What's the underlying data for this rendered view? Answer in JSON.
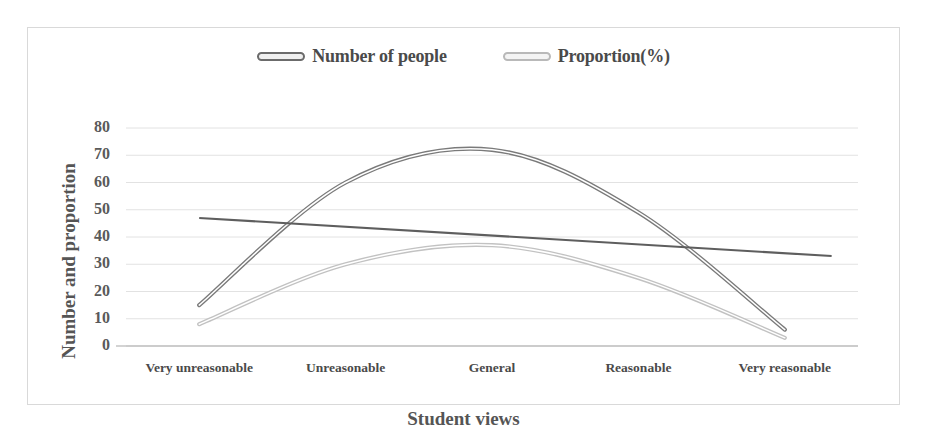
{
  "chart_data": {
    "type": "line",
    "title": "",
    "xlabel": "Student views",
    "ylabel": "Number and proportion",
    "categories": [
      "Very unreasonable",
      "Unreasonable",
      "General",
      "Reasonable",
      "Very reasonable"
    ],
    "series": [
      {
        "name": "Number of people",
        "values": [
          15,
          60,
          72,
          49,
          6
        ],
        "color": "#7a7a7a"
      },
      {
        "name": "Proportion(%)",
        "values": [
          8,
          30,
          37,
          25,
          3
        ],
        "color": "#c2c2c2"
      }
    ],
    "trendline": {
      "name": "linear-trend",
      "start_value": 47,
      "end_value": 33,
      "color": "#5e5e5e"
    },
    "ylim": [
      0,
      80
    ],
    "yticks": [
      80,
      70,
      60,
      50,
      40,
      30,
      20,
      10,
      0
    ],
    "grid": true,
    "legend_position": "top"
  },
  "legend": {
    "entries": [
      {
        "label": "Number of people",
        "swatch": "dark"
      },
      {
        "label": "Proportion(%)",
        "swatch": "light"
      }
    ]
  },
  "axes": {
    "y_title": "Number and proportion",
    "x_title": "Student views"
  }
}
